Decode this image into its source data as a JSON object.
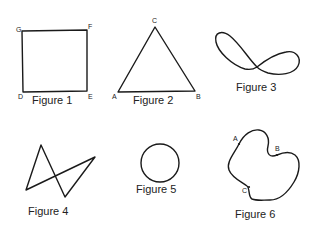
{
  "figures": [
    {
      "id": 1,
      "caption": "Figure 1",
      "shape": "square",
      "vertices": [
        "G",
        "F",
        "E",
        "D"
      ]
    },
    {
      "id": 2,
      "caption": "Figure 2",
      "shape": "triangle",
      "vertices": [
        "A",
        "B",
        "C"
      ]
    },
    {
      "id": 3,
      "caption": "Figure 3",
      "shape": "figure-eight"
    },
    {
      "id": 4,
      "caption": "Figure 4",
      "shape": "self-intersecting quadrilateral"
    },
    {
      "id": 5,
      "caption": "Figure 5",
      "shape": "circle"
    },
    {
      "id": 6,
      "caption": "Figure 6",
      "shape": "closed curve",
      "points": [
        "A",
        "B",
        "C"
      ]
    }
  ],
  "labels": {
    "fig1": {
      "G": "G",
      "F": "F",
      "D": "D",
      "E": "E"
    },
    "fig2": {
      "A": "A",
      "B": "B",
      "C": "C"
    },
    "fig6": {
      "A": "A",
      "B": "B",
      "C": "C"
    }
  }
}
